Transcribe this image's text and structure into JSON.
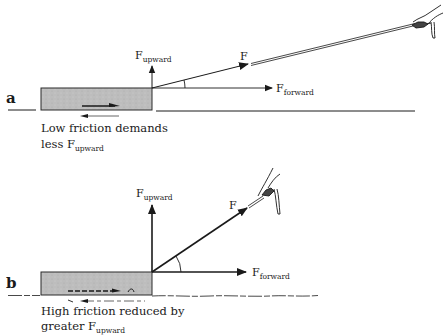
{
  "diagram": {
    "type": "force-diagram",
    "topic": "Pulling a block along a surface: upward force component vs. friction",
    "colors": {
      "ink": "#1a1a1a",
      "block_fill": "#bdbdbd",
      "block_stroke": "#2a2a2a",
      "background": "#ffffff"
    },
    "panels": [
      {
        "id": "a",
        "label": "a",
        "forces": {
          "upward": {
            "main": "F",
            "sub": "upward"
          },
          "applied": {
            "main": "F"
          },
          "forward": {
            "main": "F",
            "sub": "forward"
          }
        },
        "angle": "shallow",
        "surface": "smooth",
        "caption": {
          "line1": "Low friction demands",
          "line2_prefix": "less F",
          "line2_sub": "upward"
        }
      },
      {
        "id": "b",
        "label": "b",
        "forces": {
          "upward": {
            "main": "F",
            "sub": "upward"
          },
          "applied": {
            "main": "F"
          },
          "forward": {
            "main": "F",
            "sub": "forward"
          }
        },
        "angle": "steep",
        "surface": "rough",
        "caption": {
          "line1": "High friction reduced by",
          "line2_prefix": "greater F",
          "line2_sub": "upward"
        }
      }
    ]
  }
}
